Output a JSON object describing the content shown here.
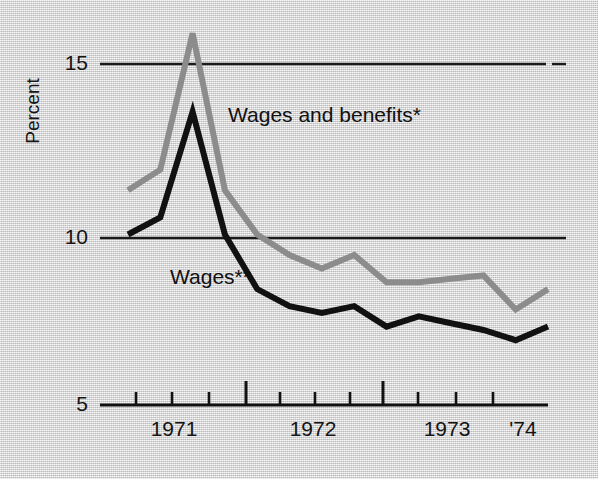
{
  "chart_data": {
    "type": "line",
    "title": "",
    "subtitle": "",
    "xlabel": "",
    "ylabel": "Percent",
    "ylim": [
      5,
      16.5
    ],
    "yticks": [
      5,
      10,
      15
    ],
    "ytick_labels": [
      "5",
      "10",
      "15"
    ],
    "grid": "horizontal-gridlines-at-10-and-15",
    "legend_position": "inline-annotations",
    "x_major_tick_labels": [
      "1971",
      "1972",
      "1973",
      "'74"
    ],
    "x_tick_count": 11,
    "x_note": "quarterly ticks; taller ticks mark the start of 1972 and 1973",
    "annotations": [
      {
        "text": "Wages and benefits*",
        "series": "Wages and benefits"
      },
      {
        "text": "Wages**",
        "series": "Wages"
      }
    ],
    "footnotes": [
      "*",
      "**"
    ],
    "x": [
      "1970 Q4",
      "1971 Q1",
      "1971 Q2",
      "1971 Q3",
      "1971 Q4",
      "1972 Q1",
      "1972 Q2",
      "1972 Q3",
      "1972 Q4",
      "1973 Q1",
      "1973 Q2",
      "1973 Q3",
      "1973 Q4",
      "1974 Q1"
    ],
    "series": [
      {
        "name": "Wages and benefits",
        "color": "#8c8c8c",
        "values": [
          11.3,
          11.9,
          15.9,
          11.3,
          10.0,
          9.4,
          9.0,
          9.4,
          8.6,
          8.6,
          8.7,
          8.8,
          7.8,
          8.4
        ]
      },
      {
        "name": "Wages",
        "color": "#111111",
        "values": [
          10.0,
          10.5,
          13.6,
          10.0,
          8.4,
          7.9,
          7.7,
          7.9,
          7.3,
          7.6,
          7.4,
          7.2,
          6.9,
          7.3
        ]
      }
    ]
  },
  "axis": {
    "y_labels": [
      "15",
      "10",
      "5"
    ],
    "x_labels": [
      "1971",
      "1972",
      "1973",
      "'74"
    ],
    "y_title": "Percent"
  },
  "labels": {
    "wages_and_benefits": "Wages and benefits*",
    "wages": "Wages**"
  },
  "colors": {
    "background": "#d9d9d9",
    "ink": "#111111",
    "series_benefits": "#8c8c8c",
    "series_wages": "#111111",
    "gridline": "#1a1a1a"
  }
}
